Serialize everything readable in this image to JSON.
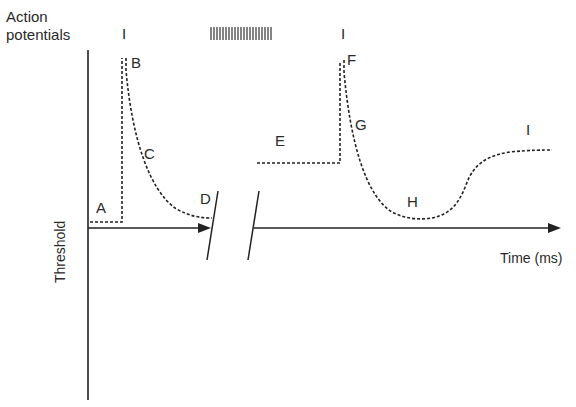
{
  "diagram": {
    "title_line1": "Action",
    "title_line2": "potentials",
    "y_axis_label": "Threshold",
    "x_axis_label": "Time (ms)",
    "spike_marks": {
      "single_1": "I",
      "burst": "IIIIIIIIIIIIIIIIII",
      "single_2": "I"
    },
    "point_labels": {
      "A": "A",
      "B": "B",
      "C": "C",
      "D": "D",
      "E": "E",
      "F": "F",
      "G": "G",
      "H": "H",
      "I": "I"
    },
    "colors": {
      "line": "#222222",
      "background": "#ffffff"
    }
  }
}
